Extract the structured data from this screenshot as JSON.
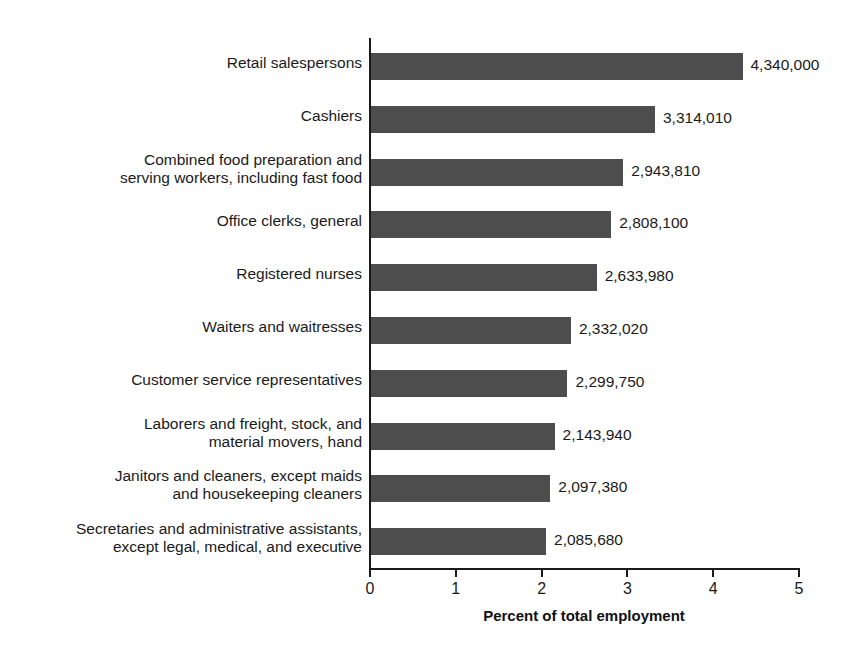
{
  "chart_data": {
    "type": "bar",
    "orientation": "horizontal",
    "title": "",
    "xlabel": "Percent of total employment",
    "ylabel": "",
    "xlim": [
      0,
      5
    ],
    "xticks": [
      "0",
      "1",
      "2",
      "3",
      "4",
      "5"
    ],
    "grid": false,
    "legend": null,
    "bar_color": "#4d4d4d",
    "categories": [
      "Retail salespersons",
      "Cashiers",
      "Combined food preparation and\nserving workers, including fast food",
      "Office clerks, general",
      "Registered nurses",
      "Waiters and waitresses",
      "Customer service representatives",
      "Laborers and freight, stock, and\nmaterial movers, hand",
      "Janitors and cleaners, except maids\nand housekeeping cleaners",
      "Secretaries and administrative assistants,\nexcept legal, medical, and executive"
    ],
    "values": [
      4.33,
      3.31,
      2.94,
      2.8,
      2.63,
      2.33,
      2.29,
      2.14,
      2.09,
      2.04
    ],
    "value_labels": [
      "4,340,000",
      "3,314,010",
      "2,943,810",
      "2,808,100",
      "2,633,980",
      "2,332,020",
      "2,299,750",
      "2,143,940",
      "2,097,380",
      "2,085,680"
    ],
    "employment_counts": [
      4340000,
      3314010,
      2943810,
      2808100,
      2633980,
      2332020,
      2299750,
      2143940,
      2097380,
      2085680
    ]
  }
}
